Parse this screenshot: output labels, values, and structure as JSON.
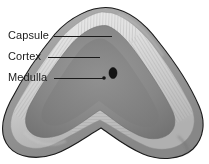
{
  "figure": {
    "type": "anatomical-diagram",
    "width": 209,
    "height": 164,
    "background_color": "#ffffff"
  },
  "labels": [
    {
      "id": "capsule",
      "text": "Capsule",
      "text_x": 8,
      "text_y": 36,
      "leader_from_x": 54,
      "leader_from_y": 36,
      "leader_to_x": 112,
      "leader_to_y": 36
    },
    {
      "id": "cortex",
      "text": "Cortex",
      "text_x": 8,
      "text_y": 57,
      "leader_from_x": 48,
      "leader_from_y": 57,
      "leader_to_x": 100,
      "leader_to_y": 57
    },
    {
      "id": "medulla",
      "text": "Medulla",
      "text_x": 8,
      "text_y": 78,
      "leader_from_x": 54,
      "leader_from_y": 78,
      "leader_to_x": 103,
      "leader_to_y": 78
    }
  ],
  "structures": {
    "capsule": {
      "name": "Capsule",
      "description": "outer fibrous boundary layer",
      "outline_color": "#1a1a1a",
      "fill_color": "#9a9a9a"
    },
    "cortex": {
      "name": "Cortex",
      "description": "pale striated band beneath the capsule",
      "fill_color": "#d8d8d8",
      "striation_color": "#a8a8a8"
    },
    "medulla": {
      "name": "Medulla",
      "description": "inner darker core region",
      "fill_color": "#8a8a8a"
    },
    "vessels": [
      {
        "id": "central-vein",
        "shape": "oval",
        "cx": 113,
        "cy": 73,
        "rx": 4,
        "ry": 5.5,
        "color": "#141414"
      },
      {
        "id": "small-vessel",
        "shape": "dot",
        "cx": 104,
        "cy": 78,
        "rx": 1.8,
        "ry": 1.8,
        "color": "#141414"
      }
    ]
  },
  "colors": {
    "outline": "#1a1a1a",
    "capsule_outer": "#9a9a9a",
    "cortex_light": "#e2e2e2",
    "cortex_mid": "#c4c4c4",
    "medulla_dark": "#7e7e7e",
    "medulla_mid": "#909090",
    "background": "#ffffff",
    "label_text": "#1a1a1a"
  }
}
